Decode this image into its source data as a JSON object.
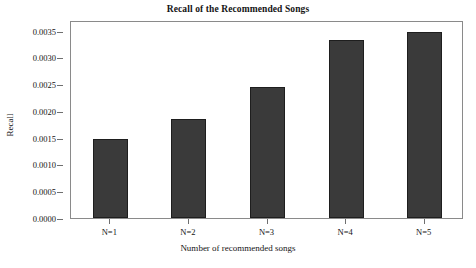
{
  "chart_data": {
    "type": "bar",
    "title": "Recall of the Recommended Songs",
    "xlabel": "Number of recommended songs",
    "ylabel": "Recall",
    "categories": [
      "N=1",
      "N=2",
      "N=3",
      "N=4",
      "N=5"
    ],
    "values": [
      0.00148,
      0.00185,
      0.00245,
      0.00332,
      0.00348
    ],
    "ylim": [
      0.0,
      0.0037
    ],
    "y_ticks": [
      0.0,
      0.0005,
      0.001,
      0.0015,
      0.002,
      0.0025,
      0.003,
      0.0035
    ],
    "y_tick_labels": [
      "0.0000",
      "0.0005",
      "0.0010",
      "0.0015",
      "0.0020",
      "0.0025",
      "0.0030",
      "0.0035"
    ],
    "grid": false,
    "legend": null,
    "bar_color": "#3a3a3a",
    "bar_edge_color": "#1e1e1e",
    "axis_color": "#8a8a8a",
    "background": "#ffffff"
  }
}
